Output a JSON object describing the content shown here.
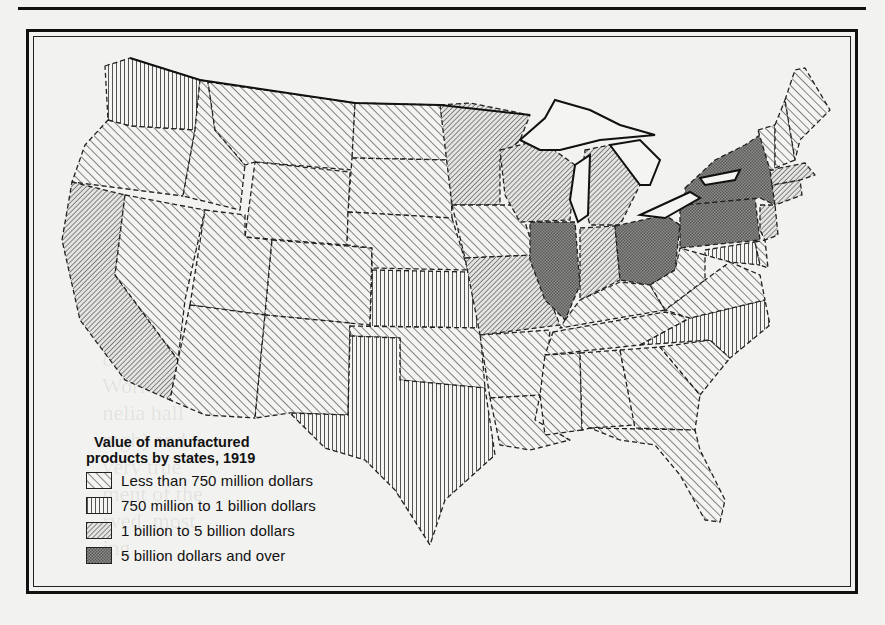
{
  "page": {
    "background": "#f2f2f0",
    "ink": "#111111"
  },
  "map": {
    "title": "Value of manufactured products by states, 1919",
    "legend": {
      "title_line1": "Value of manufactured",
      "title_line2": "products by states, 1919",
      "items": [
        {
          "label": "Less than 750 million dollars",
          "pattern": "hatch-light"
        },
        {
          "label": "750 million to 1 billion dollars",
          "pattern": "vertical"
        },
        {
          "label": "1 billion to 5 billion dollars",
          "pattern": "hatch-dense"
        },
        {
          "label": "5 billion dollars and over",
          "pattern": "crosshatch"
        }
      ]
    },
    "categories": {
      "less_than_750M": [
        "Oregon",
        "Idaho",
        "Montana",
        "Wyoming",
        "Nevada",
        "Utah",
        "Colorado",
        "Arizona",
        "New Mexico",
        "North Dakota",
        "South Dakota",
        "Nebraska",
        "Oklahoma",
        "Iowa",
        "Arkansas",
        "Louisiana",
        "Mississippi",
        "Alabama",
        "Georgia",
        "South Carolina",
        "Florida",
        "Tennessee",
        "Kentucky",
        "West Virginia",
        "Virginia",
        "Delaware",
        "Maine",
        "New Hampshire",
        "Vermont"
      ],
      "750M_to_1B": [
        "Washington",
        "Kansas",
        "Texas",
        "North Carolina",
        "Maryland"
      ],
      "1B_to_5B": [
        "California",
        "Minnesota",
        "Wisconsin",
        "Michigan",
        "Missouri",
        "Indiana",
        "Massachusetts",
        "Connecticut",
        "Rhode Island",
        "New Jersey"
      ],
      "5B_and_over": [
        "New York",
        "Pennsylvania",
        "Ohio",
        "Illinois"
      ]
    }
  },
  "ghost_text": "   of the   \n   World Wa   \n   nelia hall   \n   mgh) and   \n   very true   \n   ment of the   \n   rved, most   \n   ing   "
}
